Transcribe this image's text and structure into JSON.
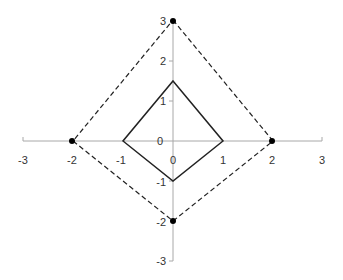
{
  "diagram": {
    "type": "coordinate-plane",
    "axes": {
      "x_ticks": [
        {
          "value": -3,
          "label": "-3"
        },
        {
          "value": -2,
          "label": "-2"
        },
        {
          "value": -1,
          "label": "-1"
        },
        {
          "value": 0,
          "label": "0"
        },
        {
          "value": 1,
          "label": "1"
        },
        {
          "value": 2,
          "label": "2"
        },
        {
          "value": 3,
          "label": "3"
        }
      ],
      "y_ticks": [
        {
          "value": 3,
          "label": "3"
        },
        {
          "value": 2,
          "label": "2"
        },
        {
          "value": 1,
          "label": "1"
        },
        {
          "value": 0,
          "label": "0"
        },
        {
          "value": -1,
          "label": "-1"
        },
        {
          "value": -2,
          "label": "-2"
        },
        {
          "value": -3,
          "label": "-3"
        }
      ],
      "xlim": [
        -3,
        3
      ],
      "ylim": [
        -3,
        3
      ],
      "axis_color": "#a0a0a0"
    },
    "shapes": [
      {
        "name": "inner-quadrilateral",
        "style": "solid",
        "color": "#222222",
        "vertices": [
          [
            0,
            1.5
          ],
          [
            1,
            0
          ],
          [
            0,
            -1
          ],
          [
            -1,
            0
          ]
        ]
      },
      {
        "name": "outer-quadrilateral",
        "style": "dashed",
        "color": "#222222",
        "vertices": [
          [
            0,
            3
          ],
          [
            2,
            0
          ],
          [
            0,
            -2
          ],
          [
            -2,
            0
          ]
        ]
      }
    ],
    "points": [
      {
        "x": 0,
        "y": 3
      },
      {
        "x": 2,
        "y": 0
      },
      {
        "x": 0,
        "y": -2
      },
      {
        "x": -2,
        "y": 0
      }
    ]
  }
}
